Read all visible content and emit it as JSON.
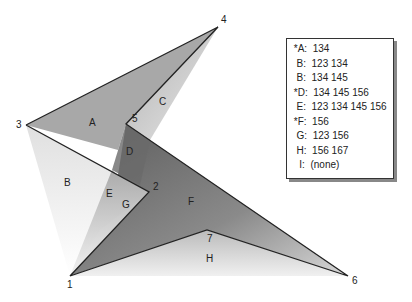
{
  "diagram": {
    "vertices": [
      {
        "id": "1",
        "x": 70,
        "y": 276
      },
      {
        "id": "2",
        "x": 149,
        "y": 192
      },
      {
        "id": "3",
        "x": 26,
        "y": 125
      },
      {
        "id": "4",
        "x": 218,
        "y": 27
      },
      {
        "id": "5",
        "x": 126,
        "y": 124
      },
      {
        "id": "6",
        "x": 348,
        "y": 276
      },
      {
        "id": "7",
        "x": 207,
        "y": 230
      }
    ],
    "regions": [
      {
        "id": "A",
        "x": 89,
        "y": 126
      },
      {
        "id": "B",
        "x": 64,
        "y": 186
      },
      {
        "id": "C",
        "x": 159,
        "y": 105
      },
      {
        "id": "D",
        "x": 126,
        "y": 155
      },
      {
        "id": "E",
        "x": 106,
        "y": 197
      },
      {
        "id": "F",
        "x": 188,
        "y": 205
      },
      {
        "id": "G",
        "x": 122,
        "y": 208
      },
      {
        "id": "H",
        "x": 206,
        "y": 262
      }
    ]
  },
  "legend": {
    "rows": [
      " *A:  134",
      "  B:  123 134",
      "  B:  134 145",
      " *D:  134 145 156",
      "  E:  123 134 145 156",
      " *F:  156",
      "  G:  123 156",
      "  H:  156 167",
      "   I:  (none)"
    ]
  }
}
